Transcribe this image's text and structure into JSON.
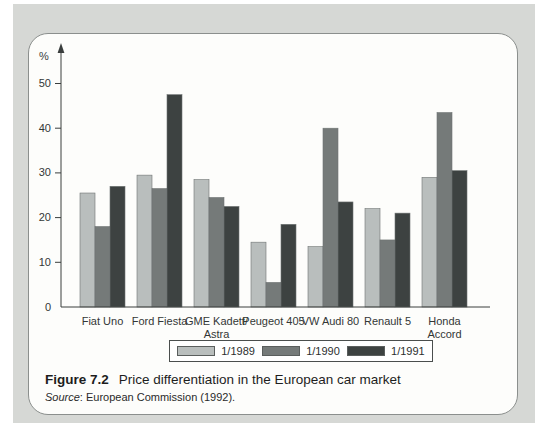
{
  "figure": {
    "label": "Figure 7.2",
    "title": "Price differentiation in the European car market",
    "source_label": "Source",
    "source_rest": ": European Commission (1992)."
  },
  "chart_data": {
    "type": "bar",
    "title": "",
    "xlabel": "",
    "ylabel": "%",
    "ylim": [
      0,
      50
    ],
    "yticks": [
      0,
      10,
      20,
      30,
      40,
      50
    ],
    "grid": false,
    "legend_position": "bottom",
    "categories": [
      "Fiat Uno",
      "Ford Fiesta",
      "GME Kadett/\nAstra",
      "Peugeot 405",
      "VW Audi 80",
      "Renault 5",
      "Honda\nAccord"
    ],
    "series": [
      {
        "name": "1/1989",
        "color": "#b9bebd",
        "values": [
          25.5,
          29.5,
          28.5,
          14.5,
          13.5,
          22,
          29
        ]
      },
      {
        "name": "1/1990",
        "color": "#757a79",
        "values": [
          18,
          26.5,
          24.5,
          5.5,
          40,
          15,
          43.5
        ]
      },
      {
        "name": "1/1991",
        "color": "#3d4241",
        "values": [
          27,
          47.5,
          22.5,
          18.5,
          23.5,
          21,
          30.5
        ]
      }
    ]
  },
  "colors": {
    "page_background": "#ffffff",
    "panel_gray": "#d6d8d5",
    "box_background": "#fdfdfb",
    "box_border": "#8b8f8d",
    "axis": "#3a3e3d",
    "text": "#2c2f2e"
  }
}
